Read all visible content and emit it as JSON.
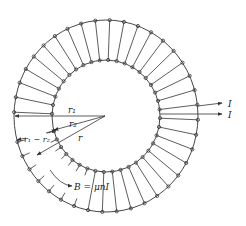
{
  "figure": {
    "type": "toroid-solenoid",
    "stroke_color": "#333333",
    "background": "#ffffff",
    "center": [
      106,
      116
    ],
    "outer_radius": [
      92,
      96
    ],
    "inner_radius": [
      54,
      56
    ],
    "winding_count": 40,
    "labels": {
      "r1": "r₁",
      "r2": "r₂",
      "r": "r",
      "r1_minus_r2": "r₁ − r₂",
      "field": "B = μnI",
      "current_in": "I",
      "current_out": "I"
    }
  }
}
